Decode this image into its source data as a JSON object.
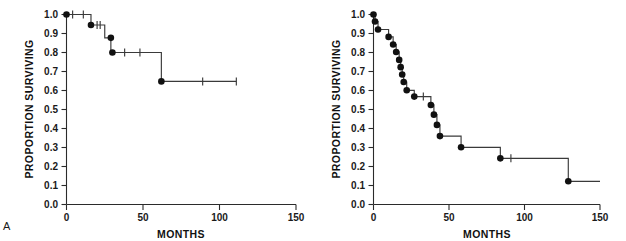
{
  "figure": {
    "panel_letters": {
      "a": "A",
      "b": "B"
    },
    "axis": {
      "y_label": "PROPORTION SURVIVING",
      "x_label": "MONTHS",
      "y_ticks": [
        "0.0",
        "0.1",
        "0.2",
        "0.3",
        "0.4",
        "0.5",
        "0.6",
        "0.7",
        "0.8",
        "0.9",
        "1.0"
      ],
      "x_ticks": [
        "0",
        "50",
        "100",
        "150"
      ]
    },
    "colors": {
      "background": "#ffffff",
      "axis": "#2b2b2b",
      "curve": "#3a3a3a",
      "event_marker": "#111111",
      "text": "#1a1a1a"
    }
  },
  "chart_data": [
    {
      "type": "line",
      "id": "panel-a",
      "panel_label": "A",
      "title": "",
      "subtitle": "",
      "xlabel": "MONTHS",
      "ylabel": "PROPORTION SURVIVING",
      "xlim": [
        0,
        150
      ],
      "ylim": [
        0.0,
        1.0
      ],
      "xticks": [
        0,
        50,
        100,
        150
      ],
      "yticks": [
        0.0,
        0.1,
        0.2,
        0.3,
        0.4,
        0.5,
        0.6,
        0.7,
        0.8,
        0.9,
        1.0
      ],
      "grid": false,
      "legend": "none",
      "plot_style": "kaplan-meier step function with event dots and censor ticks",
      "series": [
        {
          "name": "Survival group A",
          "step_points": [
            {
              "x": 0,
              "y": 1.0
            },
            {
              "x": 16,
              "y": 1.0
            },
            {
              "x": 16,
              "y": 0.945
            },
            {
              "x": 25,
              "y": 0.945
            },
            {
              "x": 25,
              "y": 0.877
            },
            {
              "x": 29,
              "y": 0.877
            },
            {
              "x": 29,
              "y": 0.8
            },
            {
              "x": 62,
              "y": 0.8
            },
            {
              "x": 62,
              "y": 0.648
            },
            {
              "x": 111,
              "y": 0.648
            }
          ],
          "event_points": [
            {
              "x": 0,
              "y": 1.0
            },
            {
              "x": 16,
              "y": 0.945
            },
            {
              "x": 29,
              "y": 0.877
            },
            {
              "x": 30,
              "y": 0.8
            },
            {
              "x": 62,
              "y": 0.648
            }
          ],
          "censor_points": [
            {
              "x": 4,
              "y": 1.0
            },
            {
              "x": 11,
              "y": 1.0
            },
            {
              "x": 20,
              "y": 0.945
            },
            {
              "x": 22,
              "y": 0.945
            },
            {
              "x": 38,
              "y": 0.8
            },
            {
              "x": 48,
              "y": 0.8
            },
            {
              "x": 89,
              "y": 0.648
            },
            {
              "x": 111,
              "y": 0.648
            }
          ]
        }
      ]
    },
    {
      "type": "line",
      "id": "panel-b",
      "panel_label": "B",
      "title": "",
      "subtitle": "",
      "xlabel": "MONTHS",
      "ylabel": "PROPORTION SURVIVING",
      "xlim": [
        0,
        150
      ],
      "ylim": [
        0.0,
        1.0
      ],
      "xticks": [
        0,
        50,
        100,
        150
      ],
      "yticks": [
        0.0,
        0.1,
        0.2,
        0.3,
        0.4,
        0.5,
        0.6,
        0.7,
        0.8,
        0.9,
        1.0
      ],
      "grid": false,
      "legend": "none",
      "plot_style": "kaplan-meier step function with event dots and censor ticks",
      "series": [
        {
          "name": "Survival group B",
          "step_points": [
            {
              "x": 0,
              "y": 1.0
            },
            {
              "x": 1,
              "y": 1.0
            },
            {
              "x": 1,
              "y": 0.963
            },
            {
              "x": 3,
              "y": 0.963
            },
            {
              "x": 3,
              "y": 0.921
            },
            {
              "x": 10,
              "y": 0.921
            },
            {
              "x": 10,
              "y": 0.882
            },
            {
              "x": 13,
              "y": 0.882
            },
            {
              "x": 13,
              "y": 0.842
            },
            {
              "x": 15,
              "y": 0.842
            },
            {
              "x": 15,
              "y": 0.803
            },
            {
              "x": 17,
              "y": 0.803
            },
            {
              "x": 17,
              "y": 0.761
            },
            {
              "x": 18,
              "y": 0.761
            },
            {
              "x": 18,
              "y": 0.723
            },
            {
              "x": 19,
              "y": 0.723
            },
            {
              "x": 19,
              "y": 0.684
            },
            {
              "x": 20,
              "y": 0.684
            },
            {
              "x": 20,
              "y": 0.645
            },
            {
              "x": 22,
              "y": 0.645
            },
            {
              "x": 22,
              "y": 0.601
            },
            {
              "x": 27,
              "y": 0.601
            },
            {
              "x": 27,
              "y": 0.568
            },
            {
              "x": 38,
              "y": 0.568
            },
            {
              "x": 38,
              "y": 0.524
            },
            {
              "x": 40,
              "y": 0.524
            },
            {
              "x": 40,
              "y": 0.473
            },
            {
              "x": 42,
              "y": 0.473
            },
            {
              "x": 42,
              "y": 0.419
            },
            {
              "x": 44,
              "y": 0.419
            },
            {
              "x": 44,
              "y": 0.36
            },
            {
              "x": 58,
              "y": 0.36
            },
            {
              "x": 58,
              "y": 0.301
            },
            {
              "x": 84,
              "y": 0.301
            },
            {
              "x": 84,
              "y": 0.243
            },
            {
              "x": 129,
              "y": 0.243
            },
            {
              "x": 129,
              "y": 0.122
            },
            {
              "x": 150,
              "y": 0.122
            }
          ],
          "event_points": [
            {
              "x": 0,
              "y": 1.0
            },
            {
              "x": 1,
              "y": 0.963
            },
            {
              "x": 3,
              "y": 0.921
            },
            {
              "x": 10,
              "y": 0.882
            },
            {
              "x": 13,
              "y": 0.842
            },
            {
              "x": 15,
              "y": 0.803
            },
            {
              "x": 17,
              "y": 0.761
            },
            {
              "x": 18,
              "y": 0.723
            },
            {
              "x": 19,
              "y": 0.684
            },
            {
              "x": 20,
              "y": 0.645
            },
            {
              "x": 22,
              "y": 0.601
            },
            {
              "x": 27,
              "y": 0.568
            },
            {
              "x": 38,
              "y": 0.524
            },
            {
              "x": 40,
              "y": 0.473
            },
            {
              "x": 42,
              "y": 0.419
            },
            {
              "x": 44,
              "y": 0.36
            },
            {
              "x": 58,
              "y": 0.301
            },
            {
              "x": 84,
              "y": 0.243
            },
            {
              "x": 129,
              "y": 0.122
            }
          ],
          "censor_points": [
            {
              "x": 33,
              "y": 0.568
            },
            {
              "x": 91,
              "y": 0.243
            }
          ]
        }
      ]
    }
  ]
}
